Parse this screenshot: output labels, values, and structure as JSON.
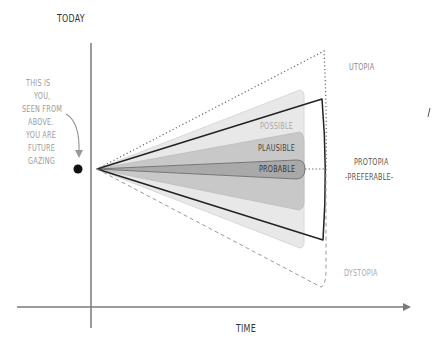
{
  "diagram": {
    "type": "futures-cone",
    "axis_labels": {
      "vertical": "TODAY",
      "horizontal": "TIME"
    },
    "annotation": [
      "THIS IS",
      "YOU,",
      "SEEN FROM",
      "ABOVE.",
      "YOU ARE",
      "FUTURE",
      "GAZING"
    ],
    "cone_labels": {
      "possible": "POSSIBLE",
      "plausible": "PLAUSIBLE",
      "probable": "PROBABLE"
    },
    "outcome_labels": {
      "utopia": "UTOPIA",
      "protopia": "PROTOPIA",
      "preferable": "-PREFERABLE-",
      "dystopia": "DYSTOPIA"
    },
    "colors": {
      "axis": "#7a7a7a",
      "possible_fill": "#e6e6e6",
      "plausible_fill": "#c9c9c9",
      "probable_fill": "#a8a8a8",
      "preferable_line": "#222222",
      "utopia_line": "#777777",
      "dystopia_line": "#999999",
      "text_dark": "#444444",
      "text_light": "#9a9a9a"
    }
  }
}
